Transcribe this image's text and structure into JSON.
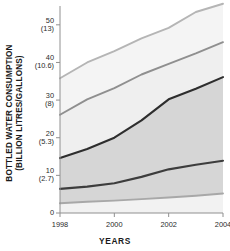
{
  "chart_data": {
    "type": "area",
    "title": "",
    "xlabel": "YEARS",
    "ylabel": "BOTTLED WATER CONSUMPTION (BILLION LITRES/GALLONS)",
    "ylabel_line1": "BOTTLED WATER CONSUMPTION",
    "ylabel_line2": "(BILLION LITRES/GALLONS)",
    "x": [
      1998,
      1999,
      2000,
      2001,
      2002,
      2003,
      2004
    ],
    "xlim": [
      1998,
      2004
    ],
    "ylim": [
      0,
      55
    ],
    "grid": false,
    "legend": false,
    "xtick_labels": [
      "1998",
      "2000",
      "2002",
      "2004"
    ],
    "xtick_values": [
      1998,
      2000,
      2002,
      2004
    ],
    "ytick_labels": [
      "50",
      "40",
      "30",
      "20",
      "10",
      "0"
    ],
    "ytick_values": [
      50,
      40,
      30,
      20,
      10,
      0
    ],
    "ytick_sublabels": [
      "(13)",
      "(10.6)",
      "(8)",
      "(5.3)",
      "(2.7)",
      ""
    ],
    "y_units": "BILLION LITRES (BILLION GALLONS)",
    "boundaries": [
      {
        "name": "boundary-1-lowest",
        "color": "#a8a8a8",
        "values": [
          2.6,
          3.0,
          3.3,
          3.7,
          4.1,
          4.6,
          5.2
        ]
      },
      {
        "name": "boundary-2",
        "color": "#3d3d3d",
        "values": [
          6.4,
          7.0,
          7.9,
          9.6,
          11.6,
          12.8,
          13.9
        ]
      },
      {
        "name": "boundary-3",
        "color": "#2e2e2e",
        "values": [
          14.6,
          17.0,
          20.0,
          24.6,
          30.2,
          33.0,
          36.1
        ]
      },
      {
        "name": "boundary-4",
        "color": "#8f8f8f",
        "values": [
          26.1,
          30.2,
          33.2,
          36.8,
          39.6,
          42.4,
          45.4
        ]
      },
      {
        "name": "boundary-5-highest",
        "color": "#b5b5b5",
        "values": [
          35.8,
          40.0,
          43.0,
          46.4,
          49.2,
          53.4,
          55.6
        ]
      }
    ],
    "bands": [
      {
        "name": "band-bottom",
        "fill": "#f2f2f2"
      },
      {
        "name": "band-2",
        "fill": "#d6d6d6"
      },
      {
        "name": "band-3",
        "fill": "#d6d6d6"
      },
      {
        "name": "band-4",
        "fill": "#efefef"
      },
      {
        "name": "band-top",
        "fill": "#f4f4f4"
      }
    ],
    "colors": {
      "axis": "#909090",
      "text": "#1a1a1a",
      "dark_line": "#2e2e2e",
      "mid_line": "#8f8f8f",
      "light_line": "#b5b5b5",
      "band_dark": "#d6d6d6",
      "band_light": "#f2f2f2"
    }
  }
}
